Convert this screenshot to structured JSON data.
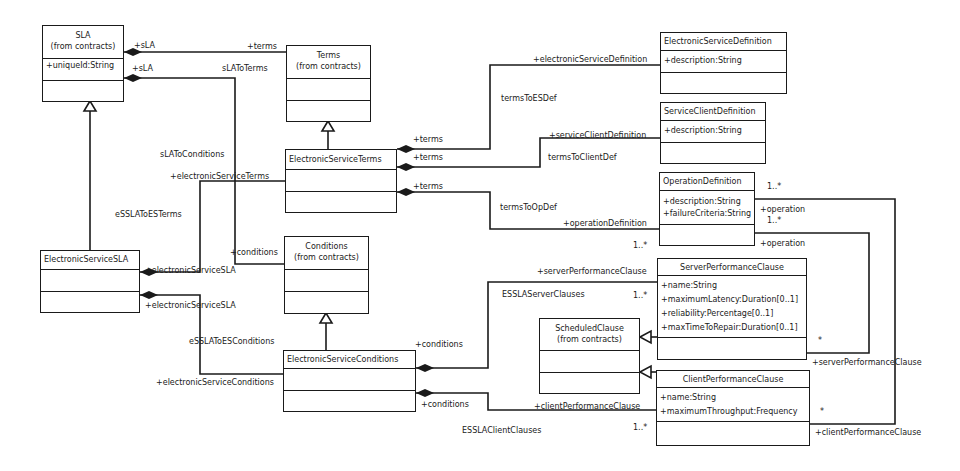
{
  "classes": {
    "sla": {
      "name": "SLA",
      "stereo": "(from contracts)",
      "attrs": [
        "+uniqueId:String"
      ]
    },
    "terms": {
      "name": "Terms",
      "stereo": "(from contracts)",
      "attrs": []
    },
    "es_terms": {
      "name": "ElectronicServiceTerms",
      "attrs": []
    },
    "conditions": {
      "name": "Conditions",
      "stereo": "(from contracts)",
      "attrs": []
    },
    "es_conditions": {
      "name": "ElectronicServiceConditions",
      "attrs": []
    },
    "es_sla": {
      "name": "ElectronicServiceSLA",
      "attrs": []
    },
    "es_definition": {
      "name": "ElectronicServiceDefinition",
      "attrs": [
        "+description:String"
      ]
    },
    "sc_definition": {
      "name": "ServiceClientDefinition",
      "attrs": [
        "+description:String"
      ]
    },
    "op_definition": {
      "name": "OperationDefinition",
      "attrs": [
        "+description:String",
        "+failureCriteria:String"
      ]
    },
    "server_clause": {
      "name": "ServerPerformanceClause",
      "attrs": [
        "+name:String",
        "+maximumLatency:Duration[0..1]",
        "+reliability:Percentage[0..1]",
        "+maxTimeToRepair:Duration[0..1]"
      ]
    },
    "client_clause": {
      "name": "ClientPerformanceClause",
      "attrs": [
        "+name:String",
        "+maximumThroughput:Frequency"
      ]
    },
    "scheduled_clause": {
      "name": "ScheduledClause",
      "stereo": "(from contracts)",
      "attrs": []
    }
  },
  "labels": {
    "sla_role_1": "+sLA",
    "sla_role_2": "+sLA",
    "terms_role": "+terms",
    "sla_to_terms": "sLAToTerms",
    "sla_to_conditions": "sLAToConditions",
    "conditions_role": "+conditions",
    "es_terms_role": "+electronicServiceTerms",
    "essla_to_esterms": "eSSLAToESTerms",
    "es_sla_role_1": "+electronicServiceSLA",
    "es_sla_role_2": "+electronicServiceSLA",
    "essla_to_esconditions": "eSSLAToESConditions",
    "es_conditions_role": "+electronicServiceConditions",
    "terms_role_a": "+terms",
    "terms_role_b": "+terms",
    "terms_role_c": "+terms",
    "terms_to_esdef": "termsToESDef",
    "es_def_role": "+electronicServiceDefinition",
    "terms_to_clientdef": "termsToClientDef",
    "sc_def_role": "+serviceClientDefinition",
    "terms_to_opdef": "termsToOpDef",
    "op_def_role": "+operationDefinition",
    "op_def_mult": "1..*",
    "conditions_role_a": "+conditions",
    "conditions_role_b": "+conditions",
    "server_clause_role": "+serverPerformanceClause",
    "esslaserver_clauses": "ESSLAServerClauses",
    "server_mult": "1..*",
    "client_clause_role": "+clientPerformanceClause",
    "esslaclient_clauses": "ESSLAClientClauses",
    "client_mult": "1..*",
    "op_mult_1": "1..*",
    "op_role_1": "+operation",
    "op_mult_2": "1..*",
    "op_role_2": "+operation",
    "server_star": "*",
    "server_role_right": "+serverPerformanceClause",
    "client_star": "*",
    "client_role_right": "+clientPerformanceClause"
  }
}
